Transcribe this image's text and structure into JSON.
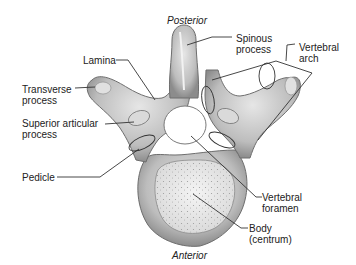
{
  "orientation": {
    "top": "Posterior",
    "bottom": "Anterior"
  },
  "labels": {
    "spinous_process": "Spinous\nprocess",
    "vertebral_arch": "Vertebral\narch",
    "lamina": "Lamina",
    "transverse_process": "Transverse\nprocess",
    "superior_articular_process": "Superior articular\nprocess",
    "pedicle": "Pedicle",
    "vertebral_foramen": "Vertebral\nforamen",
    "body": "Body\n(centrum)"
  },
  "colors": {
    "bone_fill": "#c8c8c8",
    "bone_dark": "#7a7a7a",
    "body_fill": "#ececec",
    "leader_line": "#333333",
    "text": "#222222"
  }
}
